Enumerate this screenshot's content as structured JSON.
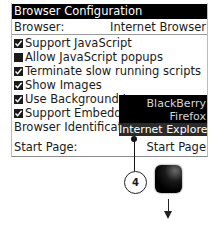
{
  "screen": {
    "title": "Browser Configuration",
    "browser": {
      "label": "Browser:",
      "value": "Internet Browser"
    },
    "options": [
      {
        "label": "Support JavaScript",
        "checked": true
      },
      {
        "label": "Allow JavaScript popups",
        "checked": false
      },
      {
        "label": "Terminate slow running scripts",
        "checked": true
      },
      {
        "label": "Show Images",
        "checked": true
      },
      {
        "label": "Use Background Images",
        "checked": true
      },
      {
        "label": "Support Embedded",
        "checked": true
      }
    ],
    "browser_identification": {
      "label": "Browser Identification"
    },
    "start_page": {
      "label": "Start Page:",
      "value": "Start Page"
    },
    "dropdown": {
      "items": [
        "BlackBerry",
        "Firefox",
        "Internet Explorer"
      ],
      "selected": "Internet Explorer"
    }
  },
  "annotation": {
    "callout_number": "4"
  },
  "colors": {
    "titlebar": "#000000",
    "dropdown_bg": "#000000",
    "dropdown_selected": "#2b2b2b"
  }
}
